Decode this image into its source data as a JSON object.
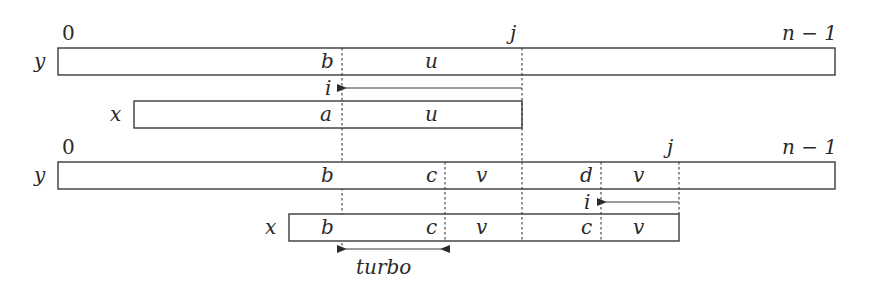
{
  "diagram": {
    "type": "string-matching-shift-illustration",
    "top": {
      "index_labels": {
        "start": "0",
        "j": "j",
        "end": "n − 1"
      },
      "row_labels": {
        "y": "y",
        "x": "x"
      },
      "y_segments": {
        "b": "b",
        "u": "u"
      },
      "x_segments": {
        "a": "a",
        "u": "u"
      },
      "arrow_label": "i"
    },
    "bottom": {
      "index_labels": {
        "start": "0",
        "j": "j",
        "end": "n − 1"
      },
      "row_labels": {
        "y": "y",
        "x": "x"
      },
      "y_segments": {
        "b": "b",
        "c": "c",
        "v1": "v",
        "d": "d",
        "v2": "v"
      },
      "x_segments": {
        "b": "b",
        "c1": "c",
        "v1": "v",
        "c2": "c",
        "v2": "v"
      },
      "arrow_label": "i",
      "turbo_label": "turbo"
    },
    "colors": {
      "stroke": "#3a3a3a",
      "text": "#2a2a2a",
      "background": "#ffffff"
    }
  }
}
